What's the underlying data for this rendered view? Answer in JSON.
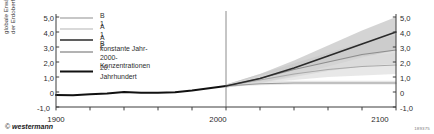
{
  "axes": {
    "ylabel": "globale Erwärmung an\nder Erdoberfläche (°C)",
    "yticks_left": [
      "5,0",
      "4,0",
      "3,0",
      "2,0",
      "1,0",
      "0",
      "-1,0"
    ],
    "yticks_right": [
      "5,0",
      "4,0",
      "3,0",
      "2,0",
      "1,0",
      "0",
      "-1,0"
    ],
    "xticks": [
      "1900",
      "2000",
      "2100"
    ]
  },
  "legend": {
    "items": [
      {
        "label": "B 1",
        "color": "#b4b4b4",
        "width": 1.3
      },
      {
        "label": "A 1 B",
        "color": "#cccccc",
        "width": 1.3
      },
      {
        "label": "A 2",
        "color": "#2a2a2a",
        "width": 1.5
      },
      {
        "label": "konstante Jahr-2000-\nKonzentrationen",
        "color": "#9a9a9a",
        "width": 1.3
      },
      {
        "label": "20. Jahrhundert",
        "color": "#111111",
        "width": 2.2
      }
    ]
  },
  "credit": {
    "mark": "©",
    "text": " westermann"
  },
  "image_code": "189375",
  "colors": {
    "background": "#ffffff",
    "axis": "#3c3c3c",
    "divider": "#6e6e6e",
    "band_a2": "#b0b0b0",
    "band_a1b": "#c4c4c4",
    "band_b1": "#d8d8d8",
    "band_const": "#dcdcdc"
  },
  "chart_data": {
    "type": "line",
    "title": "",
    "xlabel": "",
    "ylabel": "globale Erwärmung an der Erdoberfläche (°C)",
    "xlim": [
      1900,
      2100
    ],
    "ylim": [
      -1.0,
      5.0
    ],
    "yticks": [
      -1.0,
      0.0,
      1.0,
      2.0,
      3.0,
      4.0,
      5.0
    ],
    "xticks": [
      1900,
      2000,
      2100
    ],
    "grid": false,
    "legend_position": "top-left",
    "divider_year": 2000,
    "series": [
      {
        "name": "20. Jahrhundert",
        "x": [
          1900,
          1910,
          1920,
          1930,
          1940,
          1950,
          1960,
          1970,
          1980,
          1990,
          2000
        ],
        "values": [
          -0.2,
          -0.22,
          -0.15,
          -0.1,
          0.0,
          -0.05,
          -0.05,
          -0.02,
          0.1,
          0.25,
          0.4
        ]
      },
      {
        "name": "A 2",
        "x": [
          2000,
          2020,
          2040,
          2060,
          2080,
          2100
        ],
        "values": [
          0.4,
          0.9,
          1.6,
          2.4,
          3.2,
          4.0
        ],
        "band_low": [
          0.3,
          0.6,
          1.1,
          1.7,
          2.3,
          2.8
        ],
        "band_high": [
          0.5,
          1.2,
          2.1,
          3.1,
          4.1,
          5.0
        ]
      },
      {
        "name": "A 1 B",
        "x": [
          2000,
          2020,
          2040,
          2060,
          2080,
          2100
        ],
        "values": [
          0.4,
          0.9,
          1.5,
          2.0,
          2.5,
          2.8
        ],
        "band_low": [
          0.3,
          0.6,
          1.0,
          1.4,
          1.7,
          1.9
        ],
        "band_high": [
          0.5,
          1.2,
          1.9,
          2.6,
          3.3,
          3.8
        ]
      },
      {
        "name": "B 1",
        "x": [
          2000,
          2020,
          2040,
          2060,
          2080,
          2100
        ],
        "values": [
          0.4,
          0.8,
          1.2,
          1.5,
          1.7,
          1.8
        ],
        "band_low": [
          0.3,
          0.6,
          0.8,
          1.0,
          1.1,
          1.2
        ],
        "band_high": [
          0.5,
          1.1,
          1.6,
          2.0,
          2.4,
          2.6
        ]
      },
      {
        "name": "konstante Jahr-2000-Konzentrationen",
        "x": [
          2000,
          2020,
          2040,
          2060,
          2080,
          2100
        ],
        "values": [
          0.4,
          0.55,
          0.6,
          0.6,
          0.6,
          0.6
        ],
        "band_low": [
          0.35,
          0.45,
          0.5,
          0.5,
          0.5,
          0.5
        ],
        "band_high": [
          0.45,
          0.7,
          0.75,
          0.75,
          0.75,
          0.75
        ]
      }
    ]
  }
}
